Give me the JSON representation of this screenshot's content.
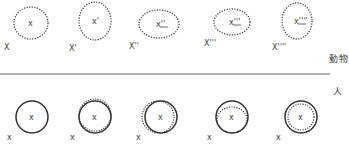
{
  "labels": {
    "animal": "動物",
    "human": "人"
  },
  "colors": {
    "stroke": "#333333",
    "dotted": "#444444",
    "divider": "#999999",
    "background": "#ffffff"
  },
  "rows": {
    "animal": {
      "items": [
        {
          "inner": "x",
          "outer": "X",
          "cx": 31,
          "cy": 23,
          "rx": 17,
          "ry": 16
        },
        {
          "inner": "x'",
          "outer": "X'",
          "cx": 95,
          "cy": 21,
          "rx": 16,
          "ry": 19
        },
        {
          "inner": "x''",
          "outer": "X''",
          "cx": 159,
          "cy": 24,
          "rx": 20,
          "ry": 14
        },
        {
          "inner": "x'''",
          "outer": "X'''",
          "cx": 232,
          "cy": 22,
          "rx": 18,
          "ry": 13
        },
        {
          "inner": "x''''",
          "outer": "X''''",
          "cx": 297,
          "cy": 21,
          "rx": 15,
          "ry": 18
        }
      ]
    },
    "human": {
      "items": [
        {
          "inner": "x",
          "outer": "x",
          "cx": 32,
          "cy": 117,
          "r": 16,
          "dotted": null
        },
        {
          "inner": "x",
          "outer": "x",
          "cx": 95,
          "cy": 117,
          "r": 16,
          "dotted": "top"
        },
        {
          "inner": "x",
          "outer": "x",
          "cx": 161,
          "cy": 117,
          "r": 16,
          "dotted": "left"
        },
        {
          "inner": "x",
          "outer": "x",
          "cx": 232,
          "cy": 117,
          "r": 16,
          "dotted": "inner-top"
        },
        {
          "inner": "x",
          "outer": "x",
          "cx": 301,
          "cy": 117,
          "r": 16,
          "dotted": "inner-bottom"
        }
      ]
    }
  },
  "divider": {
    "x1": 0,
    "x2": 330,
    "y": 74
  }
}
